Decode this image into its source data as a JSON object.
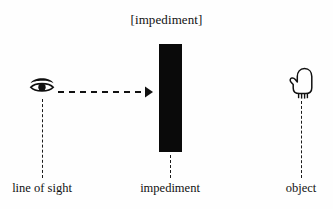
{
  "diagram": {
    "title": "[impediment]",
    "nodes": {
      "viewer": {
        "icon": "eye-icon",
        "label": "line of sight"
      },
      "barrier": {
        "icon": "black-bar",
        "label": "impediment"
      },
      "target": {
        "icon": "hand-icon",
        "label": "object"
      }
    },
    "connector": {
      "name": "sight-line-arrow",
      "style": "dashed",
      "direction": "left-to-right",
      "arrowhead": "filled-triangle"
    },
    "colors": {
      "ink": "#111111",
      "bar": "#0a0a0a",
      "background": "#fefefe"
    }
  }
}
